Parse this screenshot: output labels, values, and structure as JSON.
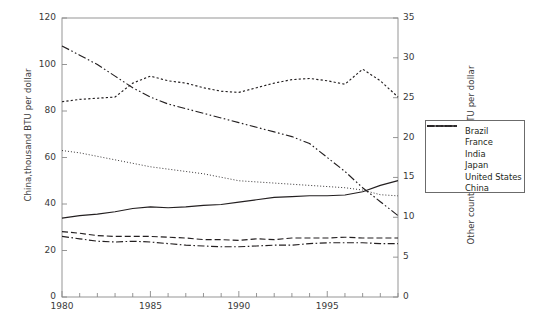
{
  "chart_data": {
    "type": "line",
    "title": "",
    "xlabel": "",
    "ylabel": "China,thousand BTU per dollar",
    "ylabel_right": "Other countries, thousand BTU per dollar",
    "xlim": [
      1980,
      1999
    ],
    "ylim": [
      0,
      120
    ],
    "ylim_right": [
      0,
      35
    ],
    "yticks": [
      0,
      20,
      40,
      60,
      80,
      100,
      120
    ],
    "yticks_right": [
      0,
      5,
      10,
      15,
      20,
      25,
      30,
      35
    ],
    "xticks": [
      1980,
      1985,
      1990,
      1995
    ],
    "xticks_minor": [
      1981,
      1982,
      1983,
      1984,
      1986,
      1987,
      1988,
      1989,
      1991,
      1992,
      1993,
      1994,
      1996,
      1997,
      1998,
      1999
    ],
    "grid": false,
    "legend_position": "right-outside",
    "x": [
      1980,
      1981,
      1982,
      1983,
      1984,
      1985,
      1986,
      1987,
      1988,
      1989,
      1990,
      1991,
      1992,
      1993,
      1994,
      1995,
      1996,
      1997,
      1998,
      1999
    ],
    "series": [
      {
        "name": "Brazil",
        "axis": "right",
        "style": "solid",
        "values": [
          9.9,
          10.2,
          10.4,
          10.7,
          11.1,
          11.3,
          11.2,
          11.3,
          11.5,
          11.6,
          11.9,
          12.2,
          12.5,
          12.6,
          12.7,
          12.7,
          12.8,
          13.2,
          14.0,
          14.6
        ]
      },
      {
        "name": "France",
        "axis": "right",
        "style": "dashed",
        "values": [
          8.2,
          8.0,
          7.7,
          7.6,
          7.6,
          7.6,
          7.5,
          7.4,
          7.2,
          7.2,
          7.1,
          7.3,
          7.2,
          7.4,
          7.4,
          7.4,
          7.5,
          7.4,
          7.4,
          7.4
        ]
      },
      {
        "name": "India",
        "axis": "left",
        "style": "dotted-dash",
        "values": [
          84,
          85,
          85.5,
          86,
          92,
          95,
          93,
          92,
          90,
          88.5,
          88,
          90,
          92,
          93.5,
          94,
          93,
          91.5,
          98,
          93,
          86
        ]
      },
      {
        "name": "Japan",
        "axis": "right",
        "style": "dash-dot",
        "values": [
          7.6,
          7.3,
          7.0,
          6.9,
          7.0,
          6.9,
          6.7,
          6.5,
          6.4,
          6.3,
          6.3,
          6.4,
          6.5,
          6.5,
          6.7,
          6.8,
          6.8,
          6.8,
          6.7,
          6.7
        ]
      },
      {
        "name": "United States",
        "axis": "left",
        "style": "fine-dotted",
        "values": [
          63,
          62,
          60.5,
          59,
          57.5,
          56,
          55,
          54,
          53,
          51.5,
          50,
          49.5,
          49,
          48.5,
          48,
          47.5,
          47,
          46,
          44,
          43.5
        ]
      },
      {
        "name": "China",
        "axis": "left",
        "style": "dash-dot-dot",
        "values": [
          108,
          104,
          100,
          95,
          90,
          86,
          83,
          81,
          79,
          77,
          75,
          73,
          71,
          69,
          66,
          60,
          54,
          47,
          41,
          35
        ]
      }
    ]
  },
  "legend": {
    "items": [
      {
        "label": "Brazil",
        "style": "solid"
      },
      {
        "label": "France",
        "style": "dashed"
      },
      {
        "label": "India",
        "style": "dotted-dash"
      },
      {
        "label": "Japan",
        "style": "dash-dot"
      },
      {
        "label": "United States",
        "style": "fine-dotted"
      },
      {
        "label": "China",
        "style": "dash-dot-dot"
      }
    ]
  },
  "axes": {
    "left_title": "China,thousand BTU per dollar",
    "right_title": "Other countries, thousand BTU per dollar",
    "left_ticks": [
      "0",
      "20",
      "40",
      "60",
      "80",
      "100",
      "120"
    ],
    "right_ticks": [
      "0",
      "5",
      "10",
      "15",
      "20",
      "25",
      "30",
      "35"
    ],
    "x_ticks": [
      "1980",
      "1985",
      "1990",
      "1995"
    ]
  },
  "colors": {
    "line": "#231f20",
    "axis": "#8a8a8a",
    "text": "#3a3a3a"
  }
}
